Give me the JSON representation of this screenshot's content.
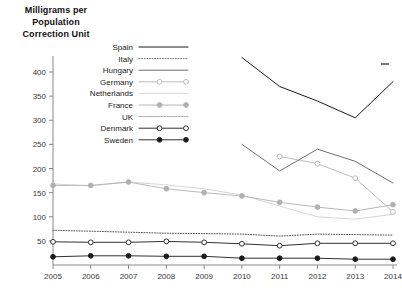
{
  "chart_data": {
    "type": "line",
    "title": "Milligrams per Population Correction Unit",
    "title_lines": [
      "Milligrams per",
      "Population",
      "Correction Unit"
    ],
    "xlabel": "",
    "ylabel": "",
    "x": [
      2005,
      2006,
      2007,
      2008,
      2009,
      2010,
      2011,
      2012,
      2013,
      2014
    ],
    "xtick_labels": [
      "2005",
      "2006",
      "2007",
      "2008",
      "2009",
      "2010",
      "2011",
      "2012",
      "2013",
      "2014"
    ],
    "ytick_labels": [
      "50",
      "100",
      "150",
      "200",
      "250",
      "300",
      "350",
      "400"
    ],
    "yticks": [
      50,
      100,
      150,
      200,
      250,
      300,
      350,
      400
    ],
    "ylim": [
      0,
      440
    ],
    "xlim": [
      2005,
      2014
    ],
    "grid": false,
    "legend_position": "top-center",
    "series": [
      {
        "name": "Spain",
        "style": "solid",
        "color": "#1a1a1a",
        "marker": "none",
        "values": [
          null,
          null,
          null,
          null,
          null,
          430,
          370,
          340,
          305,
          380
        ]
      },
      {
        "name": "Italy",
        "style": "dotted",
        "color": "#555555",
        "marker": "none",
        "values": [
          72,
          70,
          68,
          66,
          65,
          64,
          60,
          64,
          63,
          62
        ]
      },
      {
        "name": "Hungary",
        "style": "solid",
        "color": "#6f6f6f",
        "marker": "none",
        "values": [
          null,
          null,
          null,
          null,
          null,
          250,
          195,
          240,
          215,
          170
        ]
      },
      {
        "name": "Germany",
        "style": "solid-open-marker",
        "color": "#b4b4b4",
        "marker": "open-circle",
        "values": [
          null,
          null,
          null,
          null,
          null,
          null,
          225,
          210,
          180,
          110
        ]
      },
      {
        "name": "Netherlands",
        "style": "solid-thin",
        "color": "#cccccc",
        "marker": "none",
        "values": [
          168,
          164,
          172,
          166,
          158,
          145,
          122,
          100,
          95,
          105
        ]
      },
      {
        "name": "France",
        "style": "solid-filled-marker",
        "color": "#b0b0b0",
        "marker": "filled-circle",
        "values": [
          165,
          165,
          172,
          158,
          150,
          143,
          130,
          120,
          112,
          125
        ]
      },
      {
        "name": "UK",
        "style": "dashed-fine",
        "color": "#9a9a9a",
        "marker": "none",
        "values": [
          null,
          null,
          null,
          null,
          null,
          null,
          null,
          null,
          null,
          null
        ]
      },
      {
        "name": "Denmark",
        "style": "solid-open-marker",
        "color": "#1a1a1a",
        "marker": "open-circle",
        "values": [
          48,
          47,
          47,
          49,
          47,
          44,
          40,
          45,
          45,
          45
        ]
      },
      {
        "name": "Sweden",
        "style": "solid-filled-marker",
        "color": "#1a1a1a",
        "marker": "filled-circle",
        "values": [
          17,
          19,
          19,
          18,
          18,
          14,
          14,
          14,
          12,
          12
        ]
      }
    ],
    "legend_entries": [
      {
        "label": "Spain",
        "style": "solid",
        "color": "#1a1a1a",
        "marker": "none"
      },
      {
        "label": "Italy",
        "style": "dotted",
        "color": "#777777",
        "marker": "none"
      },
      {
        "label": "Hungary",
        "style": "solid",
        "color": "#6f6f6f",
        "marker": "none"
      },
      {
        "label": "Germany",
        "style": "solid-open-marker",
        "color": "#b4b4b4",
        "marker": "open-circle"
      },
      {
        "label": "Netherlands",
        "style": "solid-thin",
        "color": "#d2d2d2",
        "marker": "none"
      },
      {
        "label": "France",
        "style": "solid-filled-marker",
        "color": "#b0b0b0",
        "marker": "filled-circle"
      },
      {
        "label": "UK",
        "style": "dashed-fine",
        "color": "#9a9a9a",
        "marker": "none"
      },
      {
        "label": "Denmark",
        "style": "solid-open-marker",
        "color": "#1a1a1a",
        "marker": "open-circle"
      },
      {
        "label": "Sweden",
        "style": "solid-filled-marker",
        "color": "#1a1a1a",
        "marker": "filled-circle"
      }
    ]
  }
}
